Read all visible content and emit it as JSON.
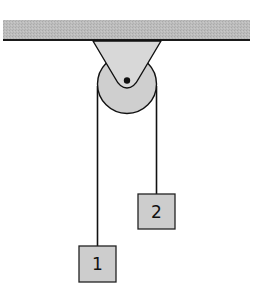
{
  "diagram": {
    "ceiling": {
      "fill": "#b8b8b8",
      "edge": "#1a1a1a"
    },
    "bracket": {
      "fill": "#d6d6d6"
    },
    "pulley": {
      "fill": "#cfcfcf",
      "axle": "#111111"
    },
    "string": {
      "color": "#111111"
    },
    "blocks": [
      {
        "id": "block-1",
        "label": "1",
        "fill": "#cdcdcd"
      },
      {
        "id": "block-2",
        "label": "2",
        "fill": "#cdcdcd"
      }
    ]
  }
}
